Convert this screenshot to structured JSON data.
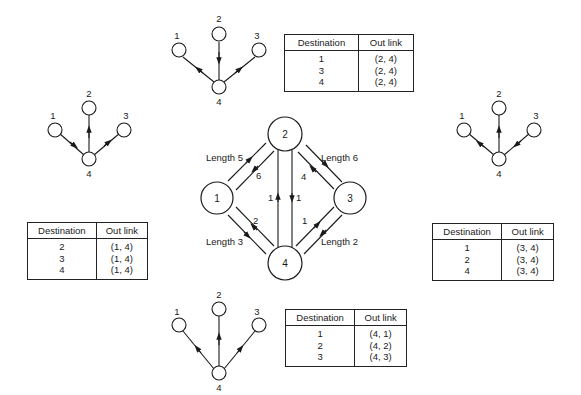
{
  "network": {
    "nodes": [
      {
        "id": "1",
        "label": "1"
      },
      {
        "id": "2",
        "label": "2"
      },
      {
        "id": "3",
        "label": "3"
      },
      {
        "id": "4",
        "label": "4"
      }
    ],
    "links": [
      {
        "pair": "1-2",
        "length_label": "Length 5",
        "forward_arrow": "1→2",
        "reverse_label": "6",
        "reverse_arrow": "2→1"
      },
      {
        "pair": "2-3",
        "length_label": "Length 6",
        "forward_arrow": "2→3",
        "reverse_label": "4",
        "reverse_arrow": "3→2"
      },
      {
        "pair": "1-4",
        "length_label": "Length 3",
        "forward_arrow": "1→4",
        "reverse_label": "2",
        "reverse_arrow": "4→1"
      },
      {
        "pair": "3-4",
        "length_label": "Length 2",
        "forward_arrow": "3→4",
        "reverse_label": "1",
        "reverse_arrow": "4→3"
      },
      {
        "pair": "2-4",
        "up_label": "1",
        "up_arrow": "4→2",
        "down_label": "1",
        "down_arrow": "2→4"
      }
    ]
  },
  "trees": {
    "top": {
      "root": "4",
      "leaves": [
        "1",
        "2",
        "3"
      ]
    },
    "left": {
      "root": "4",
      "leaves": [
        "1",
        "2",
        "3"
      ]
    },
    "right": {
      "root": "4",
      "leaves": [
        "1",
        "2",
        "3"
      ]
    },
    "bottom": {
      "root": "4",
      "leaves": [
        "1",
        "2",
        "3"
      ]
    }
  },
  "tables": {
    "header": {
      "destination": "Destination",
      "out_link": "Out link"
    },
    "node2": {
      "rows": [
        {
          "destination": "1",
          "out_link": "(2, 4)"
        },
        {
          "destination": "3",
          "out_link": "(2, 4)"
        },
        {
          "destination": "4",
          "out_link": "(2, 4)"
        }
      ]
    },
    "node1": {
      "rows": [
        {
          "destination": "2",
          "out_link": "(1, 4)"
        },
        {
          "destination": "3",
          "out_link": "(1, 4)"
        },
        {
          "destination": "4",
          "out_link": "(1, 4)"
        }
      ]
    },
    "node3": {
      "rows": [
        {
          "destination": "1",
          "out_link": "(3, 4)"
        },
        {
          "destination": "2",
          "out_link": "(3, 4)"
        },
        {
          "destination": "4",
          "out_link": "(3, 4)"
        }
      ]
    },
    "node4": {
      "rows": [
        {
          "destination": "1",
          "out_link": "(4, 1)"
        },
        {
          "destination": "2",
          "out_link": "(4, 2)"
        },
        {
          "destination": "3",
          "out_link": "(4, 3)"
        }
      ]
    }
  },
  "colors": {
    "ink": "#1a1a1a",
    "background": "#ffffff"
  }
}
